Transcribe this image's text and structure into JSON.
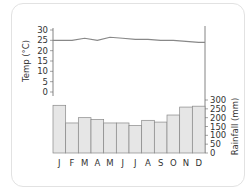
{
  "chart_data": {
    "type": "bar",
    "title": "",
    "categories": [
      "J",
      "F",
      "M",
      "A",
      "M",
      "J",
      "J",
      "A",
      "S",
      "O",
      "N",
      "D"
    ],
    "series": [
      {
        "name": "Rainfall (mm)",
        "type": "bar",
        "axis": "right",
        "values": [
          270,
          170,
          200,
          190,
          170,
          170,
          155,
          185,
          175,
          215,
          260,
          265
        ]
      },
      {
        "name": "Temp (°C)",
        "type": "line",
        "axis": "left",
        "values": [
          25,
          25,
          26,
          25,
          26.5,
          26,
          25.5,
          25.5,
          25,
          25,
          24.5,
          24
        ]
      }
    ],
    "left_axis": {
      "label": "Temp (°C)",
      "ticks": [
        0,
        5,
        10,
        15,
        20,
        25,
        30
      ],
      "ylim": [
        0,
        30
      ]
    },
    "right_axis": {
      "label": "Rainfall (mm)",
      "ticks": [
        0,
        50,
        100,
        150,
        200,
        250,
        300
      ],
      "ylim": [
        0,
        300
      ]
    },
    "colors": {
      "bars": "#e6e6e6",
      "bar_stroke": "#888888",
      "line": "#888888"
    },
    "grid": false
  }
}
